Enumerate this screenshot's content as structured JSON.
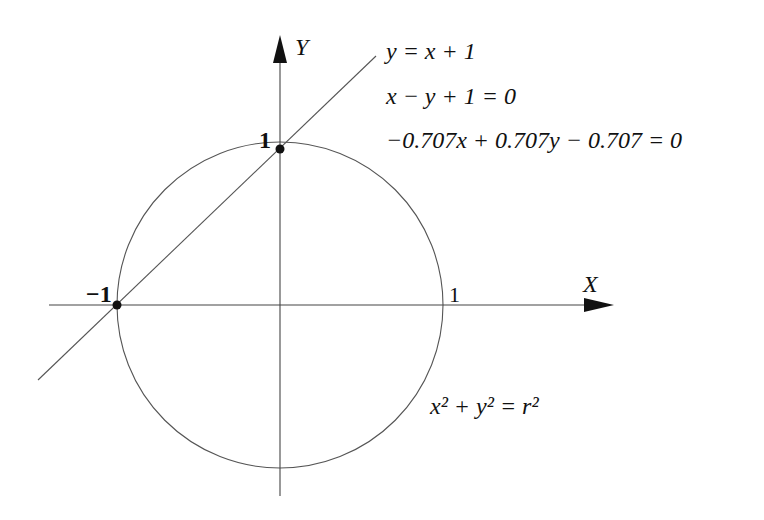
{
  "figure": {
    "axis_labels": {
      "x": "X",
      "y": "Y"
    },
    "tick_labels": {
      "y_one": "1",
      "x_neg_one": "−1",
      "x_one": "1"
    },
    "line_equations": {
      "slope_form": "y = x + 1",
      "general_form": "x − y + 1 = 0",
      "normal_form": "−0.707x + 0.707y − 0.707 = 0"
    },
    "circle_equation": "x² + y² = r²",
    "intersection_points": [
      {
        "x": 0,
        "y": 1
      },
      {
        "x": -1,
        "y": 0
      }
    ],
    "colors": {
      "stroke": "#555555",
      "axis": "#333333",
      "point": "#111111"
    }
  }
}
